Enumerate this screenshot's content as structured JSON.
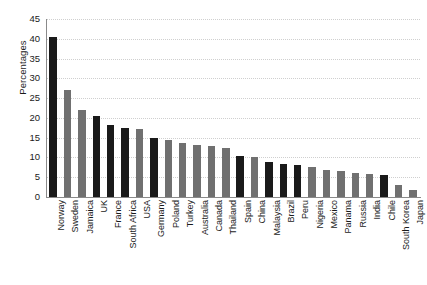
{
  "chart_data": {
    "type": "bar",
    "title": "",
    "subtitle": "",
    "xlabel": "",
    "ylabel": "Percentages",
    "ylim": [
      0,
      45
    ],
    "yticks": [
      0,
      5,
      10,
      15,
      20,
      25,
      30,
      35,
      40,
      45
    ],
    "grid": true,
    "legend": "none",
    "categories": [
      "Norway",
      "Sweden",
      "Jamaica",
      "UK",
      "France",
      "South Africa",
      "USA",
      "Germany",
      "Poland",
      "Turkey",
      "Australia",
      "Canada",
      "Thailand",
      "Spain",
      "China",
      "Malaysia",
      "Brazil",
      "Peru",
      "Nigeria",
      "Mexico",
      "Panama",
      "Russia",
      "India",
      "Chile",
      "South Korea",
      "Japan"
    ],
    "values": [
      40.5,
      27.0,
      22.0,
      20.5,
      18.3,
      17.5,
      17.3,
      15.0,
      14.5,
      13.7,
      13.2,
      13.0,
      12.5,
      10.3,
      10.0,
      8.8,
      8.3,
      8.2,
      7.5,
      6.8,
      6.7,
      6.0,
      5.8,
      5.5,
      3.0,
      1.8
    ],
    "bar_colors": [
      "#1a1a1a",
      "#707070",
      "#707070",
      "#1a1a1a",
      "#1a1a1a",
      "#1a1a1a",
      "#707070",
      "#1a1a1a",
      "#707070",
      "#707070",
      "#707070",
      "#707070",
      "#707070",
      "#1a1a1a",
      "#707070",
      "#1a1a1a",
      "#1a1a1a",
      "#1a1a1a",
      "#707070",
      "#707070",
      "#707070",
      "#707070",
      "#707070",
      "#1a1a1a",
      "#707070",
      "#707070"
    ],
    "colors": {
      "dark": "#1a1a1a",
      "gray": "#707070",
      "axis": "#8a8a8a",
      "grid": "#cfcfcf",
      "background": "#ffffff"
    }
  }
}
